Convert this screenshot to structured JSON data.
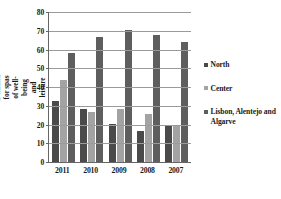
{
  "chart_data": {
    "type": "bar",
    "title": "",
    "xlabel": "",
    "ylabel": "% Demand for spas of well-being and leisure",
    "categories": [
      "2011",
      "2010",
      "2009",
      "2008",
      "2007"
    ],
    "ylim": [
      0,
      80
    ],
    "yticks": [
      0,
      10,
      20,
      30,
      40,
      50,
      60,
      70,
      80
    ],
    "grid": true,
    "legend_position": "right",
    "series": [
      {
        "name": "North",
        "color": "#4a4a4a",
        "values": [
          32.5,
          28.5,
          20.5,
          16.5,
          20.0
        ]
      },
      {
        "name": "Center",
        "color": "#a3a3a3",
        "values": [
          44.0,
          26.5,
          28.5,
          25.5,
          19.0
        ]
      },
      {
        "name": "Lisbon, Alentejo and Algarve",
        "color": "#5e5e5e",
        "values": [
          58.0,
          66.5,
          70.5,
          67.5,
          64.0
        ]
      }
    ]
  }
}
